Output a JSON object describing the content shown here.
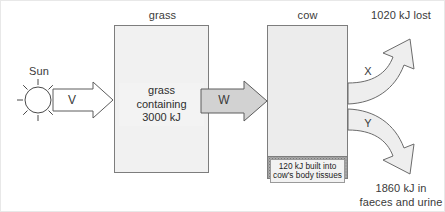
{
  "diagram": {
    "grass": {
      "title": "grass",
      "content": "grass\ncontaining\n3000 kJ"
    },
    "cow": {
      "title": "cow",
      "tissue_label": "120 kJ built into\ncow's body tissues"
    },
    "sun": {
      "label": "Sun"
    },
    "arrows": {
      "v": "V",
      "w": "W",
      "x": "X",
      "y": "Y"
    },
    "outputs": {
      "lost": "1020 kJ lost",
      "faeces": "1860 kJ in\nfaeces and urine"
    },
    "colors": {
      "grass_fill": "#f1f1f1",
      "grass_dots": "#b9b9b9",
      "cow_fill": "#ececec",
      "tissue_fill": "#a8a8a8",
      "arrow_grey": "#d2d2d2",
      "arrow_curve": "#eeeeee",
      "outline": "#7d7d7d",
      "text": "#3a3a3a"
    }
  }
}
